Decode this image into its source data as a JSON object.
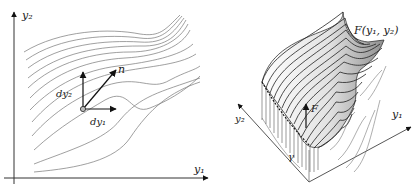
{
  "left_panel": {
    "axis_y_label": "y₂",
    "axis_x_label": "y₁",
    "vector_n_label": "n",
    "dy1_label": "dy₁",
    "dy2_label": "dy₂"
  },
  "right_panel": {
    "surface_label": "F(y₁, y₂)",
    "axis_y1_label": "y₁",
    "axis_y2_label": "y₂",
    "curve_label": "γ",
    "force_label": "F"
  },
  "colors": {
    "line": "#333333",
    "contour": "#666666",
    "surface_light": "#f2f2f2",
    "surface_dark": "#9a9a9a"
  }
}
